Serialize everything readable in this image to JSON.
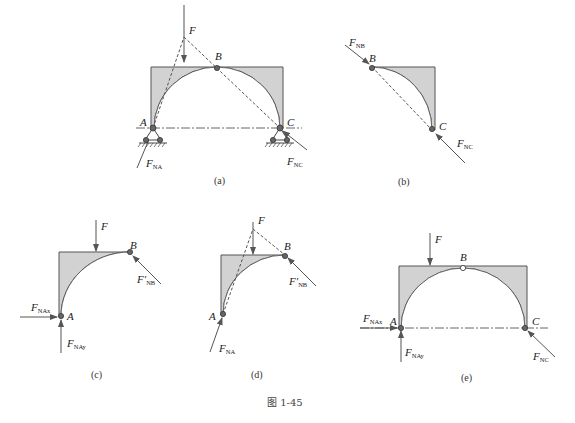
{
  "figure": {
    "caption": "图 1-45",
    "colors": {
      "body_fill": "#d2d2d2",
      "outline": "#555555",
      "background": "#ffffff"
    }
  },
  "panels": [
    {
      "id": "a",
      "caption": "(a)",
      "labels": {
        "F": "F",
        "A": "A",
        "B": "B",
        "C": "C"
      },
      "forces": [
        {
          "name": "F",
          "main": "F",
          "sub": ""
        },
        {
          "name": "F_NA",
          "main": "F",
          "sub": "NA"
        },
        {
          "name": "F_NC",
          "main": "F",
          "sub": "NC"
        }
      ]
    },
    {
      "id": "b",
      "caption": "(b)",
      "labels": {
        "B": "B",
        "C": "C"
      },
      "forces": [
        {
          "name": "F_NB",
          "main": "F",
          "sub": "NB"
        },
        {
          "name": "F_NC",
          "main": "F",
          "sub": "NC"
        }
      ]
    },
    {
      "id": "c",
      "caption": "(c)",
      "labels": {
        "F": "F",
        "A": "A",
        "B": "B"
      },
      "forces": [
        {
          "name": "F",
          "main": "F",
          "sub": ""
        },
        {
          "name": "F'_NB",
          "main": "F′",
          "sub": "NB"
        },
        {
          "name": "F_NAx",
          "main": "F",
          "sub": "NAx"
        },
        {
          "name": "F_NAy",
          "main": "F",
          "sub": "NAy"
        }
      ]
    },
    {
      "id": "d",
      "caption": "(d)",
      "labels": {
        "F": "F",
        "A": "A",
        "B": "B"
      },
      "forces": [
        {
          "name": "F",
          "main": "F",
          "sub": ""
        },
        {
          "name": "F'_NB",
          "main": "F′",
          "sub": "NB"
        },
        {
          "name": "F_NA",
          "main": "F",
          "sub": "NA"
        }
      ]
    },
    {
      "id": "e",
      "caption": "(e)",
      "labels": {
        "F": "F",
        "A": "A",
        "B": "B",
        "C": "C"
      },
      "forces": [
        {
          "name": "F",
          "main": "F",
          "sub": ""
        },
        {
          "name": "F_NAx",
          "main": "F",
          "sub": "NAx"
        },
        {
          "name": "F_NAy",
          "main": "F",
          "sub": "NAy"
        },
        {
          "name": "F_NC",
          "main": "F",
          "sub": "NC"
        }
      ]
    }
  ]
}
